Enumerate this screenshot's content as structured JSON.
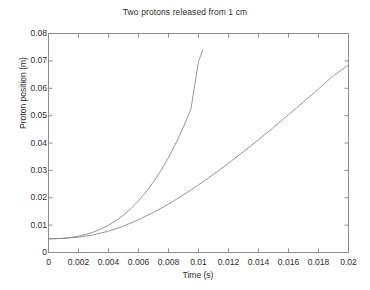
{
  "chart_data": {
    "type": "line",
    "title": "Two protons released from 1 cm",
    "xlabel": "Time (s)",
    "ylabel": "Proton position (m)",
    "xlim": [
      0,
      0.02
    ],
    "ylim": [
      0,
      0.08
    ],
    "grid": false,
    "legend": "none",
    "xticks": [
      "0",
      "0.002",
      "0.004",
      "0.006",
      "0.008",
      "0.01",
      "0.012",
      "0.014",
      "0.016",
      "0.018",
      "0.02"
    ],
    "xtick_values": [
      0,
      0.002,
      0.004,
      0.006,
      0.008,
      0.01,
      0.012,
      0.014,
      0.016,
      0.018,
      0.02
    ],
    "yticks": [
      "0",
      "0.01",
      "0.02",
      "0.03",
      "0.04",
      "0.05",
      "0.06",
      "0.07",
      "0.08"
    ],
    "ytick_values": [
      0,
      0.01,
      0.02,
      0.03,
      0.04,
      0.05,
      0.06,
      0.07,
      0.08
    ],
    "series": [
      {
        "name": "accelerating proton",
        "color": "#8a8a8a",
        "x": [
          0,
          0.0005,
          0.001,
          0.0015,
          0.002,
          0.0025,
          0.003,
          0.0035,
          0.004,
          0.0045,
          0.005,
          0.0055,
          0.006,
          0.0065,
          0.007,
          0.0075,
          0.008,
          0.0085,
          0.009,
          0.0095,
          0.01,
          0.0103
        ],
        "values": [
          0.005,
          0.00505,
          0.00522,
          0.00552,
          0.00598,
          0.00662,
          0.00748,
          0.00858,
          0.00996,
          0.01165,
          0.01368,
          0.01608,
          0.01888,
          0.02212,
          0.02582,
          0.03,
          0.03472,
          0.04,
          0.0459,
          0.0525,
          0.0698,
          0.0742
        ]
      },
      {
        "name": "slower proton",
        "color": "#8a8a8a",
        "x": [
          0,
          0.001,
          0.002,
          0.003,
          0.004,
          0.005,
          0.006,
          0.007,
          0.008,
          0.009,
          0.01,
          0.011,
          0.012,
          0.013,
          0.014,
          0.015,
          0.016,
          0.017,
          0.018,
          0.019,
          0.02
        ],
        "values": [
          0.005,
          0.00515,
          0.0056,
          0.00645,
          0.0078,
          0.00965,
          0.01195,
          0.01465,
          0.0177,
          0.02105,
          0.0247,
          0.02855,
          0.03262,
          0.03685,
          0.04122,
          0.04572,
          0.05032,
          0.05502,
          0.05978,
          0.06462,
          0.0685
        ]
      }
    ]
  }
}
